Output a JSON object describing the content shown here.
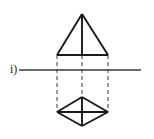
{
  "figure": {
    "label": "i)",
    "kind": "orthographic-projection-sketch",
    "canvas": {
      "width": 154,
      "height": 139,
      "background": "#ffffff"
    },
    "colors": {
      "stroke_solid": "#1a1a1a",
      "stroke_dashed": "#5a5a5a",
      "axis": "#3a3a3a",
      "label_text": "#2b2b2b",
      "background": "#ffffff"
    },
    "strokes": {
      "solid_width": 1.9,
      "dashed_width": 1.2,
      "axis_width": 1.7,
      "dash_pattern": "4,3"
    },
    "geometry": {
      "apex": {
        "x": 82,
        "y": 14
      },
      "triangle_base_left": {
        "x": 57,
        "y": 55
      },
      "triangle_base_right": {
        "x": 108,
        "y": 55
      },
      "axis_start": {
        "x": 19,
        "y": 70
      },
      "axis_end": {
        "x": 141,
        "y": 70
      },
      "diamond_top": {
        "x": 82,
        "y": 97
      },
      "diamond_left": {
        "x": 57,
        "y": 112
      },
      "diamond_right": {
        "x": 108,
        "y": 112
      },
      "diamond_bottom": {
        "x": 82,
        "y": 126
      }
    },
    "elements": [
      {
        "name": "triangle-left-edge",
        "type": "solid-line"
      },
      {
        "name": "triangle-right-edge",
        "type": "solid-line"
      },
      {
        "name": "triangle-base-edge",
        "type": "solid-line"
      },
      {
        "name": "triangle-center-axis",
        "type": "solid-line"
      },
      {
        "name": "projection-line-left",
        "type": "dashed-line"
      },
      {
        "name": "projection-line-right",
        "type": "dashed-line"
      },
      {
        "name": "projection-line-center",
        "type": "dashed-line"
      },
      {
        "name": "horizontal-axis-line",
        "type": "solid-line"
      },
      {
        "name": "diamond-upper-left-edge",
        "type": "solid-line"
      },
      {
        "name": "diamond-upper-right-edge",
        "type": "solid-line"
      },
      {
        "name": "diamond-lower-left-edge",
        "type": "solid-line"
      },
      {
        "name": "diamond-lower-right-edge",
        "type": "solid-line"
      },
      {
        "name": "diamond-horizontal-diagonal",
        "type": "solid-line"
      },
      {
        "name": "diamond-vertical-diagonal",
        "type": "solid-line"
      }
    ]
  }
}
